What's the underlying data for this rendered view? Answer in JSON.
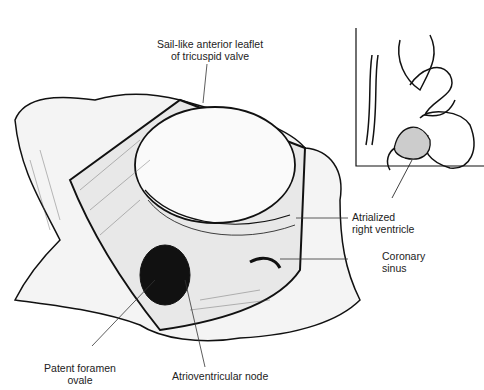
{
  "diagram": {
    "type": "anatomical-illustration",
    "labels": {
      "leaflet_line1": "Sail-like anterior leaflet",
      "leaflet_line2": "of tricuspid valve",
      "atrialized_line1": "Atrialized",
      "atrialized_line2": "right ventricle",
      "coronary_line1": "Coronary",
      "coronary_line2": "sinus",
      "pfo_line1": "Patent foramen",
      "pfo_line2": "ovale",
      "av_node": "Atrioventricular node"
    },
    "inset": {
      "description": "Heart overview with atrialized ventricle highlighted"
    }
  }
}
